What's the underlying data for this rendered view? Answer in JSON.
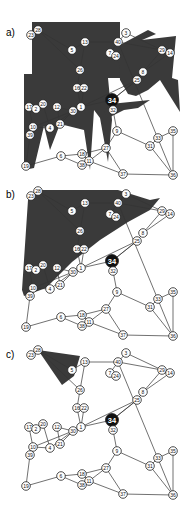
{
  "figure": {
    "panels": [
      {
        "label": "a)",
        "offset_y": -320,
        "label_x": 6,
        "label_y": 36,
        "shade_polys": [
          "32,22 120,22 120,78 108,78 112,120 108,162 100,118 94,110 90,170 84,130 60,124 50,150 44,126 34,168 24,170 24,74 32,74",
          "118,46 148,30 156,34 142,40 176,36 172,78 178,80 180,112 160,80 148,90 136,96 128,94 120,80",
          "88,40 84,44 82,48 90,44",
          "110,104 150,100 138,108 124,110 108,118 104,112"
        ]
      },
      {
        "label": "b)",
        "offset_y": -159,
        "label_x": 6,
        "label_y": 198,
        "shade_polys": [
          "40,190 118,190 150,200 160,198 150,210 128,222 100,240 72,262 46,288 24,296 22,290 28,200"
        ]
      },
      {
        "label": "c)",
        "offset_y": 0,
        "label_x": 6,
        "label_y": 358,
        "shade_polys": [
          "38,350 80,356 74,376 62,385"
        ]
      }
    ],
    "highlight_node": "34",
    "colors": {
      "shade": "#3a3a3a",
      "node_fill": "#ffffff",
      "node_stroke": "#222222",
      "edge": "#333333",
      "highlight": "#111111"
    },
    "nodes": [
      {
        "id": "23",
        "x": 31,
        "y": 355
      },
      {
        "id": "28",
        "x": 38,
        "y": 350
      },
      {
        "id": "5",
        "x": 72,
        "y": 370
      },
      {
        "id": "13",
        "x": 85,
        "y": 362
      },
      {
        "id": "40",
        "x": 118,
        "y": 362
      },
      {
        "id": "3",
        "x": 126,
        "y": 353
      },
      {
        "id": "7",
        "x": 110,
        "y": 373
      },
      {
        "id": "24",
        "x": 116,
        "y": 376
      },
      {
        "id": "29",
        "x": 162,
        "y": 370
      },
      {
        "id": "14",
        "x": 170,
        "y": 373
      },
      {
        "id": "8",
        "x": 143,
        "y": 392
      },
      {
        "id": "25",
        "x": 137,
        "y": 400
      },
      {
        "id": "26",
        "x": 80,
        "y": 390
      },
      {
        "id": "16",
        "x": 77,
        "y": 408
      },
      {
        "id": "22",
        "x": 84,
        "y": 408
      },
      {
        "id": "34",
        "x": 112,
        "y": 420
      },
      {
        "id": "32",
        "x": 113,
        "y": 430
      },
      {
        "id": "1",
        "x": 81,
        "y": 427
      },
      {
        "id": "30",
        "x": 73,
        "y": 431
      },
      {
        "id": "17",
        "x": 29,
        "y": 427
      },
      {
        "id": "2",
        "x": 36,
        "y": 429
      },
      {
        "id": "20",
        "x": 43,
        "y": 424
      },
      {
        "id": "12",
        "x": 57,
        "y": 427
      },
      {
        "id": "10",
        "x": 33,
        "y": 447
      },
      {
        "id": "39",
        "x": 30,
        "y": 455
      },
      {
        "id": "4",
        "x": 50,
        "y": 448
      },
      {
        "id": "21",
        "x": 60,
        "y": 444
      },
      {
        "id": "9",
        "x": 117,
        "y": 451
      },
      {
        "id": "35",
        "x": 173,
        "y": 451
      },
      {
        "id": "33",
        "x": 158,
        "y": 458
      },
      {
        "id": "31",
        "x": 150,
        "y": 466
      },
      {
        "id": "6",
        "x": 61,
        "y": 476
      },
      {
        "id": "18",
        "x": 82,
        "y": 474
      },
      {
        "id": "27",
        "x": 106,
        "y": 468
      },
      {
        "id": "11",
        "x": 89,
        "y": 481
      },
      {
        "id": "38",
        "x": 82,
        "y": 485
      },
      {
        "id": "19",
        "x": 26,
        "y": 486
      },
      {
        "id": "37",
        "x": 123,
        "y": 494
      },
      {
        "id": "36",
        "x": 173,
        "y": 495
      }
    ],
    "edges": [
      [
        "28",
        "23"
      ],
      [
        "28",
        "5"
      ],
      [
        "28",
        "26"
      ],
      [
        "5",
        "13"
      ],
      [
        "13",
        "26"
      ],
      [
        "13",
        "40"
      ],
      [
        "40",
        "3"
      ],
      [
        "40",
        "7"
      ],
      [
        "7",
        "24"
      ],
      [
        "40",
        "29"
      ],
      [
        "3",
        "29"
      ],
      [
        "29",
        "14"
      ],
      [
        "29",
        "8"
      ],
      [
        "14",
        "8"
      ],
      [
        "8",
        "25"
      ],
      [
        "25",
        "34"
      ],
      [
        "40",
        "36"
      ],
      [
        "26",
        "16"
      ],
      [
        "16",
        "22"
      ],
      [
        "22",
        "1"
      ],
      [
        "16",
        "1"
      ],
      [
        "1",
        "30"
      ],
      [
        "1",
        "34"
      ],
      [
        "34",
        "32"
      ],
      [
        "32",
        "9"
      ],
      [
        "30",
        "12"
      ],
      [
        "30",
        "21"
      ],
      [
        "30",
        "10"
      ],
      [
        "12",
        "21"
      ],
      [
        "17",
        "2"
      ],
      [
        "20",
        "4"
      ],
      [
        "17",
        "10"
      ],
      [
        "10",
        "4"
      ],
      [
        "4",
        "30"
      ],
      [
        "10",
        "39"
      ],
      [
        "39",
        "19"
      ],
      [
        "19",
        "6"
      ],
      [
        "6",
        "18"
      ],
      [
        "6",
        "38"
      ],
      [
        "18",
        "27"
      ],
      [
        "18",
        "11"
      ],
      [
        "11",
        "38"
      ],
      [
        "11",
        "27"
      ],
      [
        "11",
        "37"
      ],
      [
        "27",
        "9"
      ],
      [
        "27",
        "37"
      ],
      [
        "9",
        "31"
      ],
      [
        "31",
        "33"
      ],
      [
        "33",
        "35"
      ],
      [
        "35",
        "36"
      ],
      [
        "31",
        "36"
      ],
      [
        "37",
        "36"
      ],
      [
        "25",
        "34"
      ],
      [
        "1",
        "25"
      ]
    ]
  }
}
